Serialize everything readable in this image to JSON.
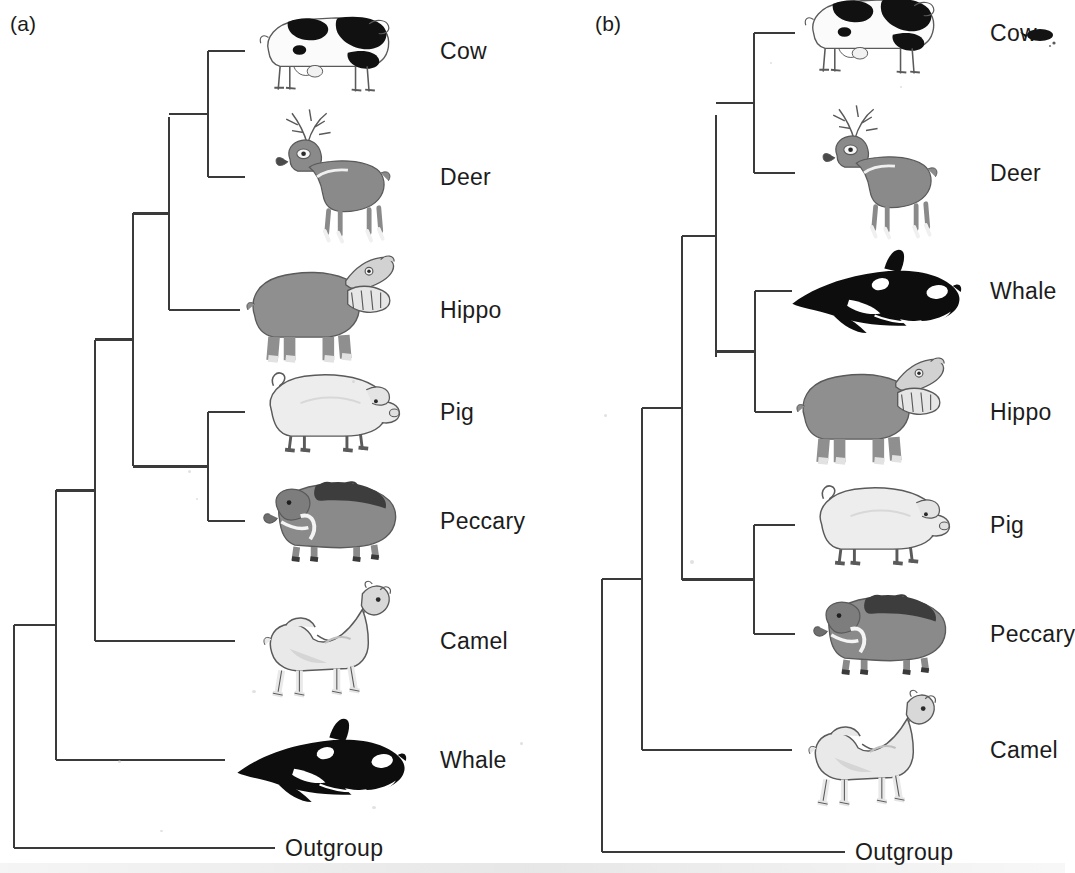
{
  "figure": {
    "type": "phylogenetic-cladogram-pair",
    "background_color": "#ffffff",
    "line_color": "#3a3a3a",
    "text_color": "#1c1c1c"
  },
  "panels": [
    {
      "id": "a",
      "label": "(a)",
      "label_x": 10,
      "label_y": 12,
      "hypothesis": "Whale is sister to all other artiodactyls (traditional morphology-based tree)",
      "tips": [
        {
          "name": "Cow",
          "label": "Cow",
          "icon": "cow-icon",
          "y": 51,
          "branch_start_x": 208,
          "branch_end_x": 245,
          "label_x": 440,
          "art_x": 255,
          "art_w": 145,
          "art_h": 110
        },
        {
          "name": "Deer",
          "label": "Deer",
          "icon": "deer-icon",
          "y": 177,
          "branch_start_x": 208,
          "branch_end_x": 245,
          "label_x": 440,
          "art_x": 265,
          "art_w": 135,
          "art_h": 140
        },
        {
          "name": "Hippo",
          "label": "Hippo",
          "icon": "hippo-icon",
          "y": 310,
          "branch_start_x": 169,
          "branch_end_x": 240,
          "label_x": 440,
          "art_x": 245,
          "art_w": 155,
          "art_h": 125
        },
        {
          "name": "Pig",
          "label": "Pig",
          "icon": "pig-icon",
          "y": 412,
          "branch_start_x": 208,
          "branch_end_x": 245,
          "label_x": 440,
          "art_x": 258,
          "art_w": 145,
          "art_h": 92
        },
        {
          "name": "Peccary",
          "label": "Peccary",
          "icon": "peccary-icon",
          "y": 521,
          "branch_start_x": 208,
          "branch_end_x": 245,
          "label_x": 440,
          "art_x": 262,
          "art_w": 140,
          "art_h": 92
        },
        {
          "name": "Camel",
          "label": "Camel",
          "icon": "camel-icon",
          "y": 641,
          "branch_start_x": 95,
          "branch_end_x": 235,
          "label_x": 440,
          "art_x": 255,
          "art_w": 140,
          "art_h": 130
        },
        {
          "name": "Whale",
          "label": "Whale",
          "icon": "whale-icon",
          "y": 760,
          "branch_start_x": 56,
          "branch_end_x": 225,
          "label_x": 440,
          "art_x": 235,
          "art_w": 175,
          "art_h": 92
        },
        {
          "name": "Outgroup",
          "label": "Outgroup",
          "icon": "none",
          "y": 848,
          "branch_start_x": 14,
          "branch_end_x": 275,
          "label_x": 285,
          "art_x": 0,
          "art_w": 0,
          "art_h": 0
        }
      ],
      "internal_nodes": [
        {
          "id": "a-n1",
          "x": 208,
          "y_top": 51,
          "y_bottom": 177,
          "parent_x": 169,
          "children": [
            "Cow",
            "Deer"
          ]
        },
        {
          "id": "a-n2",
          "x": 169,
          "y_top": 117,
          "y_bottom": 310,
          "parent_x": 133,
          "children": [
            "a-n1",
            "Hippo"
          ]
        },
        {
          "id": "a-n3",
          "x": 208,
          "y_top": 412,
          "y_bottom": 521,
          "parent_x": 133,
          "children": [
            "Pig",
            "Peccary"
          ]
        },
        {
          "id": "a-n4",
          "x": 133,
          "y_top": 213,
          "y_bottom": 466,
          "parent_x": 95,
          "children": [
            "a-n2",
            "a-n3"
          ]
        },
        {
          "id": "a-n5",
          "x": 95,
          "y_top": 340,
          "y_bottom": 641,
          "parent_x": 56,
          "children": [
            "a-n4",
            "Camel"
          ]
        },
        {
          "id": "a-n6",
          "x": 56,
          "y_top": 490,
          "y_bottom": 760,
          "parent_x": 14,
          "children": [
            "a-n5",
            "Whale"
          ]
        },
        {
          "id": "a-root",
          "x": 14,
          "y_top": 625,
          "y_bottom": 848,
          "parent_x": null,
          "children": [
            "a-n6",
            "Outgroup"
          ]
        }
      ]
    },
    {
      "id": "b",
      "label": "(b)",
      "label_x": 62,
      "label_y": 12,
      "hypothesis": "Whale is sister to Hippo (molecular-based tree)",
      "tips": [
        {
          "name": "Cow",
          "label": "Cow",
          "icon": "cow-icon",
          "y": 33,
          "branch_start_x": 754,
          "branch_end_x": 795,
          "label_x": 990,
          "art_x": 800,
          "art_w": 145,
          "art_h": 110
        },
        {
          "name": "Deer",
          "label": "Deer",
          "icon": "deer-icon",
          "y": 173,
          "branch_start_x": 754,
          "branch_end_x": 795,
          "label_x": 990,
          "art_x": 812,
          "art_w": 135,
          "art_h": 140
        },
        {
          "name": "Whale",
          "label": "Whale",
          "icon": "whale-icon",
          "y": 291,
          "branch_start_x": 755,
          "branch_end_x": 792,
          "label_x": 990,
          "art_x": 790,
          "art_w": 175,
          "art_h": 92
        },
        {
          "name": "Hippo",
          "label": "Hippo",
          "icon": "hippo-icon",
          "y": 412,
          "branch_start_x": 755,
          "branch_end_x": 792,
          "label_x": 990,
          "art_x": 795,
          "art_w": 155,
          "art_h": 125
        },
        {
          "name": "Pig",
          "label": "Pig",
          "icon": "pig-icon",
          "y": 525,
          "branch_start_x": 754,
          "branch_end_x": 795,
          "label_x": 990,
          "art_x": 808,
          "art_w": 145,
          "art_h": 92
        },
        {
          "name": "Peccary",
          "label": "Peccary",
          "icon": "peccary-icon",
          "y": 634,
          "branch_start_x": 754,
          "branch_end_x": 795,
          "label_x": 990,
          "art_x": 812,
          "art_w": 140,
          "art_h": 92
        },
        {
          "name": "Camel",
          "label": "Camel",
          "icon": "camel-icon",
          "y": 750,
          "branch_start_x": 642,
          "branch_end_x": 792,
          "label_x": 990,
          "art_x": 800,
          "art_w": 140,
          "art_h": 130
        },
        {
          "name": "Outgroup",
          "label": "Outgroup",
          "icon": "none",
          "y": 852,
          "branch_start_x": 602,
          "branch_end_x": 845,
          "label_x": 855,
          "art_x": 0,
          "art_w": 0,
          "art_h": 0
        }
      ],
      "internal_nodes": [
        {
          "id": "b-n1",
          "x": 754,
          "y_top": 33,
          "y_bottom": 173,
          "parent_x": 716,
          "children": [
            "Cow",
            "Deer"
          ]
        },
        {
          "id": "b-n2",
          "x": 755,
          "y_top": 291,
          "y_bottom": 412,
          "parent_x": 716,
          "children": [
            "Whale",
            "Hippo"
          ]
        },
        {
          "id": "b-n3",
          "x": 716,
          "y_top": 115,
          "y_bottom": 357,
          "parent_x": 682,
          "children": [
            "b-n1",
            "b-n2"
          ]
        },
        {
          "id": "b-n4",
          "x": 754,
          "y_top": 525,
          "y_bottom": 634,
          "parent_x": 682,
          "children": [
            "Pig",
            "Peccary"
          ]
        },
        {
          "id": "b-n5",
          "x": 682,
          "y_top": 236,
          "y_bottom": 580,
          "parent_x": 642,
          "children": [
            "b-n3",
            "b-n4"
          ]
        },
        {
          "id": "b-n6",
          "x": 642,
          "y_top": 408,
          "y_bottom": 750,
          "parent_x": 602,
          "children": [
            "b-n5",
            "Camel"
          ]
        },
        {
          "id": "b-root",
          "x": 602,
          "y_top": 579,
          "y_bottom": 852,
          "parent_x": null,
          "children": [
            "b-n6",
            "Outgroup"
          ]
        }
      ]
    }
  ],
  "colors": {
    "line": "#3a3a3a",
    "cow_black": "#111111",
    "cow_white": "#fbfbfb",
    "deer_gray": "#8a8a8a",
    "hippo_gray": "#8f8f8f",
    "pig_light": "#ededed",
    "peccary_gray": "#8a8a8a",
    "peccary_dark": "#3d3d3d",
    "camel_light": "#e9e9e9",
    "whale_black": "#0d0d0d",
    "outline": "#5a5a5a"
  }
}
